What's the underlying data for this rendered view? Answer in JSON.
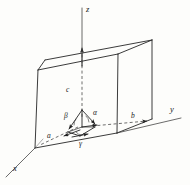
{
  "figure": {
    "background_color": "#fdfdfb",
    "line_color": "#262626",
    "label_color": "#1a1a1a"
  },
  "axes": [
    {
      "key": "z",
      "label": "z",
      "direction": "vertical-up",
      "style": "solid-and-dashed"
    },
    {
      "key": "y",
      "label": "y",
      "direction": "horizontal-right",
      "style": "solid-and-dashed"
    },
    {
      "key": "x",
      "label": "x",
      "direction": "lower-left",
      "style": "solid"
    }
  ],
  "vectors": [
    {
      "key": "a",
      "label": "a",
      "description": "lattice vector along x"
    },
    {
      "key": "b",
      "label": "b",
      "description": "lattice vector along y"
    },
    {
      "key": "c",
      "label": "c",
      "description": "lattice vector along z"
    }
  ],
  "angles": [
    {
      "key": "alpha",
      "label": "α",
      "description": "angle between b and c"
    },
    {
      "key": "beta",
      "label": "β",
      "description": "angle between a and c"
    },
    {
      "key": "gamma",
      "label": "γ",
      "description": "angle between a and b"
    }
  ],
  "cell_labels": {
    "a_along_axis": "a",
    "b_along_axis": "b",
    "c_along_axis": "c"
  }
}
